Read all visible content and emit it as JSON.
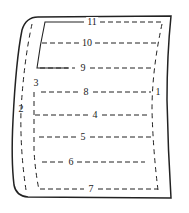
{
  "diagram": {
    "type": "fold-pattern",
    "stroke_color": "#222222",
    "background": "#ffffff",
    "labels": [
      {
        "id": "11",
        "text": "11",
        "x": 92,
        "y": 22
      },
      {
        "id": "10",
        "text": "10",
        "x": 87,
        "y": 43
      },
      {
        "id": "9",
        "text": "9",
        "x": 83,
        "y": 68
      },
      {
        "id": "8",
        "text": "8",
        "x": 86,
        "y": 92
      },
      {
        "id": "3",
        "text": "3",
        "x": 36,
        "y": 84
      },
      {
        "id": "1",
        "text": "1",
        "x": 157,
        "y": 92
      },
      {
        "id": "2",
        "text": "2",
        "x": 21,
        "y": 109
      },
      {
        "id": "4",
        "text": "4",
        "x": 95,
        "y": 115
      },
      {
        "id": "5",
        "text": "5",
        "x": 82,
        "y": 137
      },
      {
        "id": "6",
        "text": "6",
        "x": 71,
        "y": 162
      },
      {
        "id": "7",
        "text": "7",
        "x": 91,
        "y": 189
      }
    ]
  }
}
